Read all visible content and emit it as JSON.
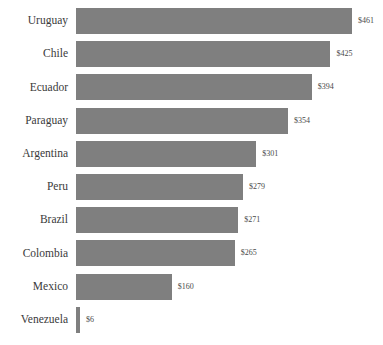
{
  "chart_data": {
    "type": "bar",
    "orientation": "horizontal",
    "title": "",
    "subtitle": "",
    "xlabel": "",
    "ylabel": "",
    "grid": false,
    "legend": false,
    "value_prefix": "$",
    "xlim": [
      0,
      461
    ],
    "categories": [
      "Uruguay",
      "Chile",
      "Ecuador",
      "Paraguay",
      "Argentina",
      "Peru",
      "Brazil",
      "Colombia",
      "Mexico",
      "Venezuela"
    ],
    "values": [
      461,
      425,
      394,
      354,
      301,
      279,
      271,
      265,
      160,
      6
    ],
    "value_labels": [
      "$461",
      "$425",
      "$394",
      "$354",
      "$301",
      "$279",
      "$271",
      "$265",
      "$160",
      "$6"
    ],
    "bar_color": "#7f7f7f",
    "background_color": "#ffffff",
    "label_color": "#3a3a3a",
    "value_label_color": "#4a4a4a"
  },
  "layout": {
    "plot_left": 76,
    "row_pitch": 33.2,
    "bar_height": 26,
    "top_offset": 8,
    "px_per_unit": 0.5986,
    "value_gap": 6
  }
}
